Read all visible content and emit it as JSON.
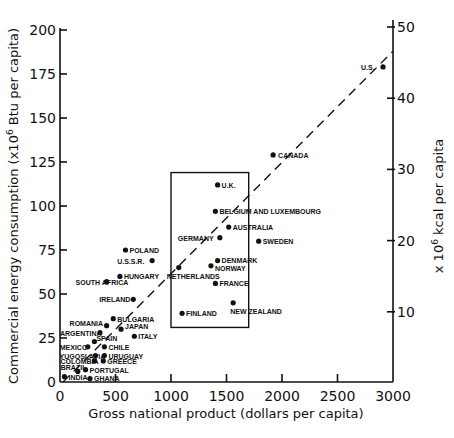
{
  "chart_data": {
    "type": "scatter",
    "title": "",
    "xlabel": "Gross national product (dollars per capita)",
    "ylabel": "Commercial energy consumption (x10^6 Btu per capita)",
    "y2label": "x 10^6 kcal per capita",
    "xlim": [
      0,
      3000
    ],
    "ylim": [
      0,
      200
    ],
    "y2lim": [
      0,
      50
    ],
    "x_ticks": [
      0,
      500,
      1000,
      1500,
      2000,
      2500,
      3000
    ],
    "y_ticks": [
      0,
      25,
      50,
      75,
      100,
      125,
      150,
      175,
      200
    ],
    "y2_ticks": [
      10,
      20,
      30,
      40,
      50
    ],
    "grid": false,
    "trend_line": {
      "style": "dashed",
      "from": [
        0,
        0
      ],
      "to": [
        3000,
        188
      ]
    },
    "highlight_box": {
      "x": [
        1000,
        1700
      ],
      "y": [
        31,
        119
      ]
    },
    "points": [
      {
        "label": "U.S.",
        "x": 2910,
        "y": 179,
        "lx": -22,
        "ly": 3
      },
      {
        "label": "CANADA",
        "x": 1920,
        "y": 129,
        "lx": 5,
        "ly": 3
      },
      {
        "label": "U.K.",
        "x": 1420,
        "y": 112,
        "lx": 4,
        "ly": 3
      },
      {
        "label": "BELGIUM AND LUXEMBOURG",
        "x": 1400,
        "y": 97,
        "lx": 4,
        "ly": 3
      },
      {
        "label": "AUSTRALIA",
        "x": 1520,
        "y": 88,
        "lx": 4,
        "ly": 3
      },
      {
        "label": "GERMANY",
        "x": 1440,
        "y": 82,
        "lx": -42,
        "ly": 3
      },
      {
        "label": "SWEDEN",
        "x": 1790,
        "y": 80,
        "lx": 4,
        "ly": 3
      },
      {
        "label": "DENMARK",
        "x": 1420,
        "y": 69,
        "lx": 4,
        "ly": 2
      },
      {
        "label": "NORWAY",
        "x": 1360,
        "y": 66,
        "lx": 4,
        "ly": 5
      },
      {
        "label": "NETHERLANDS",
        "x": 1070,
        "y": 65,
        "lx": -12,
        "ly": 11
      },
      {
        "label": "FRANCE",
        "x": 1400,
        "y": 56,
        "lx": 4,
        "ly": 3
      },
      {
        "label": "NEW ZEALAND",
        "x": 1560,
        "y": 45,
        "lx": -3,
        "ly": 11
      },
      {
        "label": "FINLAND",
        "x": 1100,
        "y": 39,
        "lx": 4,
        "ly": 3
      },
      {
        "label": "POLAND",
        "x": 590,
        "y": 75,
        "lx": 4,
        "ly": 3
      },
      {
        "label": "U.S.S.R.",
        "x": 830,
        "y": 69,
        "lx": -35,
        "ly": 3
      },
      {
        "label": "HUNGARY",
        "x": 540,
        "y": 60,
        "lx": 4,
        "ly": 3
      },
      {
        "label": "SOUTH AFRICA",
        "x": 420,
        "y": 57,
        "lx": -31,
        "ly": 3
      },
      {
        "label": "IRELAND",
        "x": 660,
        "y": 47,
        "lx": -34,
        "ly": 3
      },
      {
        "label": "BULGARIA",
        "x": 480,
        "y": 36,
        "lx": 4,
        "ly": 3
      },
      {
        "label": "ROMANIA",
        "x": 420,
        "y": 32,
        "lx": -37,
        "ly": 0
      },
      {
        "label": "JAPAN",
        "x": 550,
        "y": 30,
        "lx": 4,
        "ly": 0
      },
      {
        "label": "ITALY",
        "x": 670,
        "y": 26,
        "lx": 4,
        "ly": 3
      },
      {
        "label": "ARGENTINA",
        "x": 360,
        "y": 28,
        "lx": -40,
        "ly": 3
      },
      {
        "label": "SPAIN",
        "x": 310,
        "y": 23,
        "lx": 2,
        "ly": -1
      },
      {
        "label": "CHILE",
        "x": 400,
        "y": 20,
        "lx": 4,
        "ly": 3
      },
      {
        "label": "MEXICO",
        "x": 250,
        "y": 20,
        "lx": -28,
        "ly": 3
      },
      {
        "label": "URUGUAY",
        "x": 400,
        "y": 15,
        "lx": 4,
        "ly": 3
      },
      {
        "label": "YUGOSLAVIA",
        "x": 320,
        "y": 15,
        "lx": -36,
        "ly": 3
      },
      {
        "label": "GREECE",
        "x": 390,
        "y": 12,
        "lx": 4,
        "ly": 3
      },
      {
        "label": "COLOMBIA",
        "x": 310,
        "y": 12,
        "lx": -34,
        "ly": 3
      },
      {
        "label": "PORTUGAL",
        "x": 230,
        "y": 7,
        "lx": 4,
        "ly": 3
      },
      {
        "label": "BRAZIL",
        "x": 160,
        "y": 6,
        "lx": -17,
        "ly": -1
      },
      {
        "label": "INDIA",
        "x": 40,
        "y": 3,
        "lx": 4,
        "ly": 3
      },
      {
        "label": "GHANA",
        "x": 270,
        "y": 2,
        "lx": 4,
        "ly": 3
      }
    ]
  }
}
